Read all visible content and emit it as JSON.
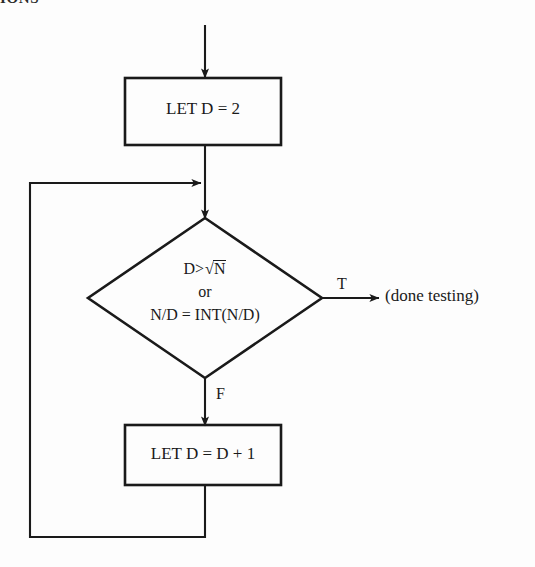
{
  "page": {
    "header_fragment": "IONS",
    "background_color": "#fdfdfd",
    "ink_color": "#1a1a1a",
    "width": 535,
    "height": 567
  },
  "flowchart": {
    "title": "Prime testing inner loop flowchart",
    "entry_arrow": {
      "name": "entry-arrow",
      "from": [
        205,
        25
      ],
      "to": [
        205,
        78
      ]
    },
    "nodes": [
      {
        "id": "init",
        "type": "process",
        "label": "LET D = 2",
        "x": 125,
        "y": 78,
        "width": 156,
        "height": 67
      },
      {
        "id": "condition",
        "type": "decision",
        "lines": [
          "D>√N",
          "or",
          "N/D = INT(N/D)"
        ],
        "line1_prefix": "D>",
        "line1_radicand": "N",
        "line2": "or",
        "line3": "N/D = INT(N/D)",
        "center_x": 205,
        "center_y": 298,
        "half_width": 117,
        "half_height": 80
      },
      {
        "id": "increment",
        "type": "process",
        "label": "LET D = D + 1",
        "x": 125,
        "y": 425,
        "width": 156,
        "height": 60
      }
    ],
    "branches": [
      {
        "id": "true-branch",
        "label": "T",
        "target_text": "(done testing)",
        "arrow_from": [
          322,
          298
        ],
        "arrow_to": [
          378,
          298
        ],
        "label_x": 337,
        "label_y": 276
      },
      {
        "id": "false-branch",
        "label": "F",
        "arrow_from": [
          205,
          378
        ],
        "arrow_to": [
          205,
          425
        ],
        "label_x": 216,
        "label_y": 386
      }
    ],
    "connectors": [
      {
        "id": "init-to-condition",
        "from": [
          205,
          145
        ],
        "to": [
          205,
          218
        ],
        "arrowhead": true
      },
      {
        "id": "loop-back",
        "description": "from increment box bottom, down, left, up, right into main spine above the decision",
        "path": [
          [
            205,
            485
          ],
          [
            205,
            537
          ],
          [
            30,
            537
          ],
          [
            30,
            183
          ],
          [
            200,
            183
          ]
        ],
        "arrowhead": true,
        "arrow_target": [
          203,
          183
        ]
      }
    ]
  }
}
